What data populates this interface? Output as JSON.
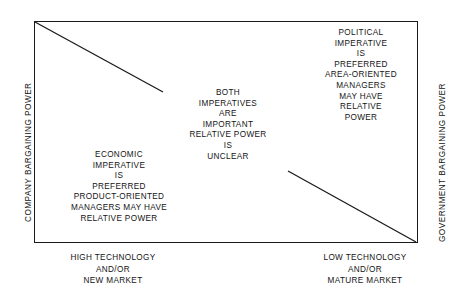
{
  "figure": {
    "type": "2x2 strategy matrix",
    "axes": {
      "left_label": "COMPANY BARGAINING POWER",
      "right_label": "GOVERNMENT BARGAINING POWER",
      "bottom_left_label": [
        "HIGH TECHNOLOGY",
        "AND/OR",
        "NEW MARKET"
      ],
      "bottom_right_label": [
        "LOW TECHNOLOGY",
        "AND/OR",
        "MATURE MARKET"
      ]
    },
    "cells": {
      "left": {
        "lines": [
          "ECONOMIC",
          "IMPERATIVE",
          "IS",
          "PREFERRED",
          "PRODUCT-ORIENTED",
          "MANAGERS MAY HAVE",
          "RELATIVE POWER"
        ]
      },
      "center": {
        "lines": [
          "BOTH",
          "IMPERATIVES",
          "ARE",
          "IMPORTANT",
          "RELATIVE POWER",
          "IS",
          "UNCLEAR"
        ]
      },
      "right": {
        "lines": [
          "POLITICAL",
          "IMPERATIVE",
          "IS",
          "PREFERRED",
          "AREA-ORIENTED",
          "MANAGERS",
          "MAY HAVE",
          "RELATIVE",
          "POWER"
        ]
      }
    },
    "colors": {
      "line": "#1a1a1a",
      "text": "#141414",
      "background": "#ffffff"
    }
  }
}
